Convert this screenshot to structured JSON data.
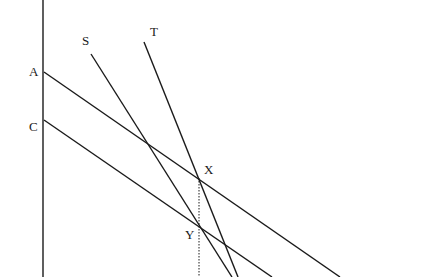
{
  "diagram": {
    "type": "line-diagram",
    "colors": {
      "line": "#1a1a1a",
      "background": "#ffffff"
    },
    "axis": {
      "x": 43,
      "y1": 0,
      "y2": 277
    },
    "lines": [
      {
        "id": "A",
        "label": "A",
        "x1": 44,
        "y1": 72,
        "x2": 340,
        "y2": 277,
        "label_x": 29,
        "label_y": 65
      },
      {
        "id": "C",
        "label": "C",
        "x1": 44,
        "y1": 120,
        "x2": 272,
        "y2": 277,
        "label_x": 29,
        "label_y": 120
      },
      {
        "id": "S",
        "label": "S",
        "x1": 91,
        "y1": 54,
        "x2": 232,
        "y2": 277,
        "label_x": 82,
        "label_y": 34
      },
      {
        "id": "T",
        "label": "T",
        "x1": 144,
        "y1": 42,
        "x2": 238,
        "y2": 277,
        "label_x": 150,
        "label_y": 25
      }
    ],
    "points": [
      {
        "id": "X",
        "label": "X",
        "x": 199,
        "y": 178,
        "label_x": 204,
        "label_y": 163
      },
      {
        "id": "Y",
        "label": "Y",
        "x": 199,
        "y": 226,
        "label_x": 185,
        "label_y": 228
      }
    ],
    "dotted_line": {
      "x": 199,
      "y1": 178,
      "y2": 277
    }
  }
}
